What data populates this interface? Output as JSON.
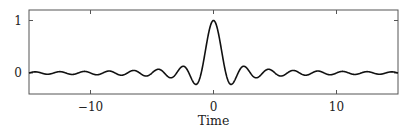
{
  "chart_data": {
    "type": "line",
    "title": "",
    "xlabel": "Time",
    "ylabel": "",
    "xlim": [
      -15,
      15
    ],
    "ylim": [
      -0.4,
      1.2
    ],
    "grid": false,
    "legend": null,
    "xticks": [
      -10,
      0,
      10
    ],
    "xtick_labels": [
      "−10",
      "0",
      "10"
    ],
    "yticks": [
      0,
      1
    ],
    "ytick_labels": [
      "0",
      "1"
    ],
    "function": "sinc(t) = sin(pi t) / (pi t)",
    "series": [
      {
        "name": "sinc",
        "color": "#111111",
        "x": [
          -15,
          -14.5,
          -14,
          -13.5,
          -13,
          -12.5,
          -12,
          -11.5,
          -11,
          -10.5,
          -10,
          -9.5,
          -9,
          -8.5,
          -8,
          -7.5,
          -7,
          -6.5,
          -6,
          -5.5,
          -5,
          -4.5,
          -4,
          -3.5,
          -3,
          -2.5,
          -2,
          -1.5,
          -1.43,
          -1,
          -0.5,
          0,
          0.5,
          1,
          1.43,
          1.5,
          2,
          2.5,
          3,
          3.5,
          4,
          4.5,
          5,
          5.5,
          6,
          6.5,
          7,
          7.5,
          8,
          8.5,
          9,
          9.5,
          10,
          10.5,
          11,
          11.5,
          12,
          12.5,
          13,
          13.5,
          14,
          14.5,
          15
        ],
        "y": [
          0,
          0.022,
          0,
          -0.024,
          0,
          0.025,
          0,
          -0.028,
          0,
          0.03,
          0,
          -0.034,
          0,
          0.037,
          0,
          -0.042,
          0,
          0.049,
          0,
          -0.058,
          0,
          0.071,
          0,
          -0.091,
          0,
          0.127,
          0,
          -0.212,
          -0.217,
          0,
          0.637,
          1,
          0.637,
          0,
          -0.217,
          -0.212,
          0,
          0.127,
          0,
          -0.091,
          0,
          0.071,
          0,
          -0.058,
          0,
          0.049,
          0,
          -0.042,
          0,
          0.037,
          0,
          -0.034,
          0,
          0.03,
          0,
          -0.028,
          0,
          0.025,
          0,
          -0.024,
          0,
          0.022,
          0
        ]
      }
    ]
  },
  "plot_area": {
    "left": 29,
    "top": 10,
    "right": 398,
    "bottom": 94
  }
}
